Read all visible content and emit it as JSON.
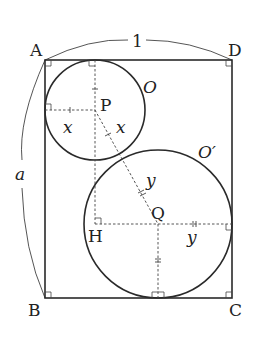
{
  "figure": {
    "type": "geometry",
    "points": {
      "A": "A",
      "B": "B",
      "C": "C",
      "D": "D",
      "P": "P",
      "Q": "Q",
      "H": "H"
    },
    "circles": {
      "small": "O",
      "large": "O′"
    },
    "labels": {
      "width": "1",
      "height": "a",
      "radius_small_horizontal": "x",
      "radius_small_diagonal": "x",
      "radius_large_diagonal": "y",
      "radius_large_horizontal": "y"
    },
    "colors": {
      "stroke": "#2a2a2a",
      "background": "#ffffff"
    }
  }
}
